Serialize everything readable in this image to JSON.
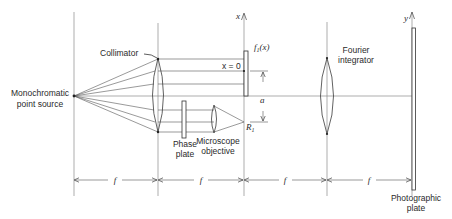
{
  "diagram": {
    "title": "",
    "labels": {
      "source": [
        "Monochromatic",
        "point source"
      ],
      "collimator": "Collimator",
      "object_function": "f",
      "object_function_sub": "1",
      "object_function_arg": "(x)",
      "x_zero": "x = 0",
      "x_axis": "x",
      "y_axis": "y",
      "separation": "a",
      "reference_point": "R",
      "reference_point_sub": "1",
      "phase_plate": [
        "Phase",
        "plate"
      ],
      "microscope_objective": [
        "Microscope",
        "objective"
      ],
      "fourier_integrator": [
        "Fourier",
        "integrator"
      ],
      "photographic_plate": [
        "Photographic",
        "plate"
      ],
      "focal_lengths": [
        "f",
        "f",
        "f",
        "f"
      ]
    },
    "components": [
      "Monochromatic point source",
      "Collimator",
      "Phase plate",
      "Microscope objective",
      "Object f1(x)",
      "Fourier integrator",
      "Photographic plate"
    ]
  }
}
